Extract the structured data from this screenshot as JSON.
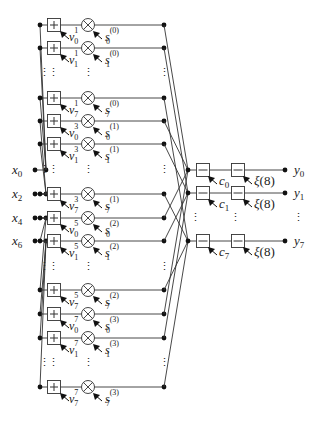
{
  "figure": {
    "inputs": [
      {
        "name": "x",
        "sub": "0",
        "y": 170
      },
      {
        "name": "x",
        "sub": "2",
        "y": 194
      },
      {
        "name": "x",
        "sub": "4",
        "y": 218
      },
      {
        "name": "x",
        "sub": "6",
        "y": 241
      }
    ],
    "branches": [
      {
        "y": 25,
        "v": "v",
        "v_sup": "1",
        "v_sub": "0",
        "s": "s",
        "s_sup": "(0)",
        "s_sub": "0",
        "src": 0
      },
      {
        "y": 48,
        "v": "v",
        "v_sup": "1",
        "v_sub": "1",
        "s": "s",
        "s_sup": "(0)",
        "s_sub": "1",
        "src": 0
      },
      {
        "y": 98,
        "v": "v",
        "v_sup": "1",
        "v_sub": "7",
        "s": "s",
        "s_sup": "(0)",
        "s_sub": "7",
        "src": 0
      },
      {
        "y": 121,
        "v": "v",
        "v_sup": "3",
        "v_sub": "0",
        "s": "s",
        "s_sup": "(1)",
        "s_sub": "0",
        "src": 1
      },
      {
        "y": 144,
        "v": "v",
        "v_sup": "3",
        "v_sub": "1",
        "s": "s",
        "s_sup": "(1)",
        "s_sub": "1",
        "src": 1
      },
      {
        "y": 194,
        "v": "v",
        "v_sup": "3",
        "v_sub": "7",
        "s": "s",
        "s_sup": "(1)",
        "s_sub": "7",
        "src": 1
      },
      {
        "y": 218,
        "v": "v",
        "v_sup": "5",
        "v_sub": "0",
        "s": "s",
        "s_sup": "(2)",
        "s_sub": "0",
        "src": 2
      },
      {
        "y": 241,
        "v": "v",
        "v_sup": "5",
        "v_sub": "1",
        "s": "s",
        "s_sup": "(2)",
        "s_sub": "1",
        "src": 2
      },
      {
        "y": 290,
        "v": "v",
        "v_sup": "5",
        "v_sub": "7",
        "s": "s",
        "s_sup": "(2)",
        "s_sub": "7",
        "src": 2
      },
      {
        "y": 314,
        "v": "v",
        "v_sup": "7",
        "v_sub": "0",
        "s": "s",
        "s_sup": "(3)",
        "s_sub": "0",
        "src": 3
      },
      {
        "y": 338,
        "v": "v",
        "v_sup": "7",
        "v_sub": "1",
        "s": "s",
        "s_sup": "(3)",
        "s_sub": "1",
        "src": 3
      },
      {
        "y": 387,
        "v": "v",
        "v_sup": "7",
        "v_sub": "7",
        "s": "s",
        "s_sup": "(3)",
        "s_sub": "7",
        "src": 3
      }
    ],
    "ellipsis_rows": [
      72,
      169,
      266,
      362
    ],
    "outputs": [
      {
        "y": 170,
        "c": "c",
        "c_sub": "0",
        "xi": "ξ(8)",
        "out": "y",
        "out_sub": "0"
      },
      {
        "y": 193,
        "c": "c",
        "c_sub": "1",
        "xi": "ξ(8)",
        "out": "y",
        "out_sub": "1"
      },
      {
        "y": 241,
        "c": "c",
        "c_sub": "7",
        "xi": "ξ(8)",
        "out": "y",
        "out_sub": "7"
      }
    ],
    "output_ellipsis_y": 217,
    "symbols": {
      "plus": "+",
      "times": "⊗",
      "minus": "−",
      "vdots": "⋮"
    },
    "colors": {
      "line": "#333333",
      "dot": "#111111",
      "text": "#222222"
    }
  }
}
